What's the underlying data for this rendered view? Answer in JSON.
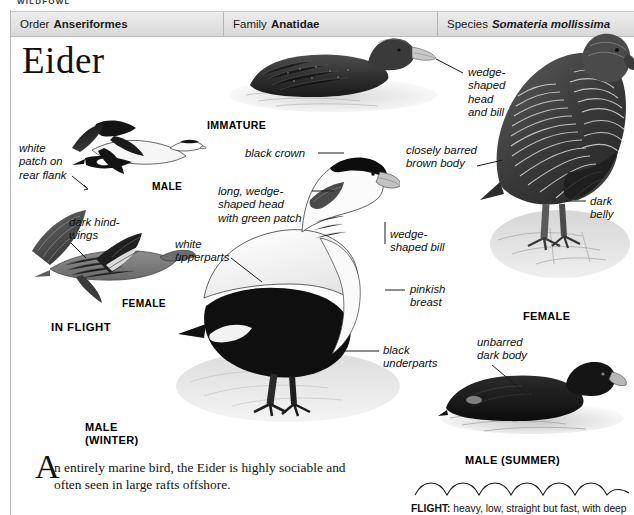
{
  "page": {
    "running_head": "WILDFOWL",
    "species_title": "Eider"
  },
  "classification": {
    "order": {
      "label": "Order",
      "value": "Anseriformes"
    },
    "family": {
      "label": "Family",
      "value": "Anatidae"
    },
    "species": {
      "label": "Species",
      "value": "Somateria mollissima"
    }
  },
  "annotations": {
    "white_patch": "white\npatch on\nrear flank",
    "dark_hindwings": "dark hind-\nwings",
    "black_crown": "black crown",
    "wedge_head_green": "long, wedge-\nshaped head\nwith green patch",
    "white_upperparts": "white\nupperparts",
    "wedge_head_bill": "wedge-\nshaped\nhead\nand bill",
    "closely_barred": "closely barred\nbrown body",
    "dark_belly": "dark\nbelly",
    "wedge_bill": "wedge-\nshaped bill",
    "pinkish_breast": "pinkish\nbreast",
    "black_underparts": "black\nunderparts",
    "unbarred_dark_body": "unbarred\ndark body"
  },
  "captions": {
    "male_flight": "MALE",
    "female_flight": "FEMALE",
    "in_flight": "IN FLIGHT",
    "immature": "IMMATURE",
    "female": "FEMALE",
    "male_winter": "MALE\n(WINTER)",
    "male_summer": "MALE (SUMMER)"
  },
  "body_text": {
    "dropcap": "A",
    "paragraph": "n entirely marine bird, the Eider is highly sociable and often seen in large rafts offshore."
  },
  "flight": {
    "label": "FLIGHT:",
    "description": " heavy, low, straight but fast, with deep"
  },
  "colors": {
    "header_bar": "#e2e2e2",
    "rule": "#b9b9b9",
    "text": "#111111"
  }
}
